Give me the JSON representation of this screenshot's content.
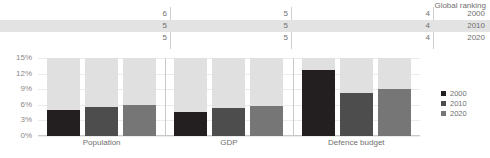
{
  "chart_data": {
    "type": "bar",
    "title": "",
    "subtitle": "",
    "xlabel": "",
    "ylabel": "",
    "ylim": [
      0,
      15
    ],
    "ytick_labels": [
      "15%",
      "12%",
      "9%",
      "6%",
      "3%",
      "0%"
    ],
    "ytick_values": [
      15,
      12,
      9,
      6,
      3,
      0
    ],
    "grid": true,
    "legend_position": "right",
    "categories": [
      "Population",
      "GDP",
      "Defence budget"
    ],
    "series": [
      {
        "name": "2000",
        "color": "#231f20",
        "values": [
          5.0,
          4.6,
          12.7
        ]
      },
      {
        "name": "2010",
        "color": "#4d4d4d",
        "values": [
          5.6,
          5.4,
          8.3
        ]
      },
      {
        "name": "2020",
        "color": "#767676",
        "values": [
          6.0,
          5.8,
          9.1
        ]
      }
    ],
    "remainder_color": "#e0e0e0",
    "annotations": {
      "table_title": "Global ranking",
      "table_row_labels": [
        "2000",
        "2010",
        "2020"
      ],
      "table_values": {
        "Population": [
          "6",
          "5",
          "5"
        ],
        "GDP": [
          "5",
          "5",
          "5"
        ],
        "Defence budget": [
          "4",
          "4",
          "4"
        ]
      },
      "highlighted_row": "2010"
    }
  },
  "ranking": {
    "title": "Global ranking",
    "rows": [
      {
        "year": "2000",
        "population": "6",
        "gdp": "5",
        "defence": "4"
      },
      {
        "year": "2010",
        "population": "5",
        "gdp": "5",
        "defence": "4"
      },
      {
        "year": "2020",
        "population": "5",
        "gdp": "5",
        "defence": "4"
      }
    ]
  },
  "yaxis": {
    "ticks": [
      "15%",
      "12%",
      "9%",
      "6%",
      "3%",
      "0%"
    ]
  },
  "groups": [
    {
      "label": "Population"
    },
    {
      "label": "GDP"
    },
    {
      "label": "Defence budget"
    }
  ],
  "legend": {
    "items": [
      {
        "label": "2000",
        "color": "#231f20"
      },
      {
        "label": "2010",
        "color": "#4d4d4d"
      },
      {
        "label": "2020",
        "color": "#767676"
      }
    ]
  }
}
